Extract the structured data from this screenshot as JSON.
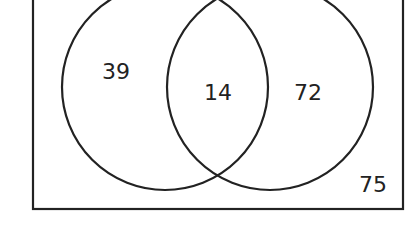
{
  "diagram": {
    "type": "venn",
    "sets": [
      "A",
      "B"
    ],
    "regions": {
      "only_left": "39",
      "intersection": "14",
      "only_right": "72",
      "outside": "75"
    },
    "colors": {
      "stroke": "#222222",
      "background": "#ffffff"
    }
  }
}
